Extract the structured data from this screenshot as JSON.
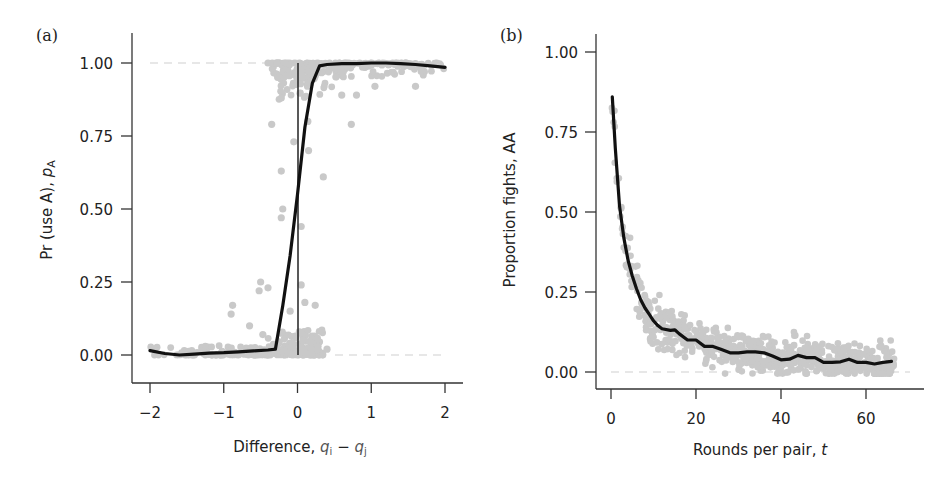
{
  "chart_data": [
    {
      "panel": "(a)",
      "type": "scatter",
      "title": "",
      "xlabel": "Difference, q_i − q_j",
      "xlabel_parts": {
        "main": "Difference, ",
        "var1": "q",
        "sub1": "i",
        "op": " − ",
        "var2": "q",
        "sub2": "j"
      },
      "ylabel": "Pr (use A), p_A",
      "ylabel_parts": {
        "main": "Pr (use A), ",
        "var": "p",
        "sub": "A"
      },
      "xlim": [
        -2.2,
        2.25
      ],
      "ylim": [
        -0.1,
        1.1
      ],
      "xticks": [
        -2,
        -1,
        0,
        1,
        2
      ],
      "xtick_labels": [
        "−2",
        "−1",
        "0",
        "1",
        "2"
      ],
      "yticks": [
        0,
        0.25,
        0.5,
        0.75,
        1.0
      ],
      "ytick_labels": [
        "0.00",
        "0.25",
        "0.50",
        "0.75",
        "1.00"
      ],
      "reference_lines": {
        "horizontal_dashed": [
          0,
          1
        ],
        "vertical_solid_x": 0
      },
      "grid": false,
      "series": [
        {
          "name": "fitted curve",
          "style": "line",
          "x": [
            -2.0,
            -1.8,
            -1.6,
            -1.4,
            -1.2,
            -1.0,
            -0.8,
            -0.6,
            -0.4,
            -0.3,
            -0.2,
            -0.1,
            0.0,
            0.1,
            0.2,
            0.3,
            0.4,
            0.6,
            0.8,
            1.0,
            1.2,
            1.4,
            1.6,
            1.8,
            2.0
          ],
          "y": [
            0.015,
            0.005,
            0.0,
            0.003,
            0.006,
            0.008,
            0.011,
            0.014,
            0.017,
            0.02,
            0.17,
            0.34,
            0.55,
            0.78,
            0.93,
            0.99,
            0.995,
            0.998,
            0.998,
            1.0,
            1.0,
            0.998,
            0.995,
            0.99,
            0.985
          ]
        },
        {
          "name": "observations",
          "style": "scatter",
          "note": "dense grey points clustered at 0 for x<0 and at 1 for x>0; sparse intermediates near x=0",
          "highlighted_points": [
            {
              "x": -0.9,
              "y": 0.14
            },
            {
              "x": -0.88,
              "y": 0.17
            },
            {
              "x": -0.65,
              "y": 0.1
            },
            {
              "x": -0.5,
              "y": 0.25
            },
            {
              "x": -0.52,
              "y": 0.22
            },
            {
              "x": -0.4,
              "y": 0.23
            },
            {
              "x": -0.47,
              "y": 0.07
            },
            {
              "x": -0.35,
              "y": 0.79
            },
            {
              "x": -0.22,
              "y": 0.88
            },
            {
              "x": -0.22,
              "y": 0.63
            },
            {
              "x": -0.2,
              "y": 0.5
            },
            {
              "x": -0.22,
              "y": 0.47
            },
            {
              "x": -0.1,
              "y": 0.15
            },
            {
              "x": 0.05,
              "y": 0.44
            },
            {
              "x": 0.05,
              "y": 0.24
            },
            {
              "x": 0.1,
              "y": 0.18
            },
            {
              "x": 0.24,
              "y": 0.17
            },
            {
              "x": 0.14,
              "y": 0.8
            },
            {
              "x": 0.15,
              "y": 0.7
            },
            {
              "x": -0.05,
              "y": 0.73
            },
            {
              "x": 0.35,
              "y": 0.61
            },
            {
              "x": 0.6,
              "y": 0.89
            },
            {
              "x": 0.8,
              "y": 0.89
            },
            {
              "x": 0.73,
              "y": 0.79
            },
            {
              "x": 1.05,
              "y": 0.92
            },
            {
              "x": 1.6,
              "y": 0.92
            },
            {
              "x": -0.4,
              "y": 1.0
            },
            {
              "x": 0.4,
              "y": 0.02
            }
          ]
        }
      ]
    },
    {
      "panel": "(b)",
      "type": "scatter",
      "title": "",
      "xlabel": "Rounds per pair, t",
      "xlabel_parts": {
        "main": "Rounds per pair, ",
        "var": "t"
      },
      "ylabel": "Proportion fights, AA",
      "xlim": [
        -4,
        74
      ],
      "ylim": [
        -0.05,
        1.05
      ],
      "xticks": [
        0,
        20,
        40,
        60
      ],
      "xtick_labels": [
        "0",
        "20",
        "40",
        "60"
      ],
      "yticks": [
        0,
        0.25,
        0.5,
        0.75,
        1.0
      ],
      "ytick_labels": [
        "0.00",
        "0.25",
        "0.50",
        "0.75",
        "1.00"
      ],
      "reference_lines": {
        "horizontal_dashed": [
          0
        ]
      },
      "grid": false,
      "series": [
        {
          "name": "fitted curve",
          "style": "line",
          "x": [
            0.3,
            1,
            2,
            3,
            4,
            5,
            6,
            7,
            8,
            9,
            10,
            11,
            12,
            14,
            15,
            16,
            18,
            20,
            22,
            24,
            26,
            28,
            30,
            32,
            34,
            36,
            38,
            40,
            42,
            44,
            46,
            48,
            50,
            52,
            54,
            56,
            58,
            60,
            62,
            64,
            66
          ],
          "y": [
            0.86,
            0.7,
            0.52,
            0.42,
            0.35,
            0.3,
            0.26,
            0.225,
            0.2,
            0.18,
            0.16,
            0.145,
            0.135,
            0.13,
            0.132,
            0.12,
            0.1,
            0.1,
            0.08,
            0.08,
            0.07,
            0.06,
            0.06,
            0.063,
            0.063,
            0.06,
            0.05,
            0.038,
            0.04,
            0.052,
            0.045,
            0.045,
            0.03,
            0.03,
            0.032,
            0.04,
            0.03,
            0.03,
            0.025,
            0.03,
            0.033
          ]
        },
        {
          "name": "observations",
          "style": "scatter",
          "note": "grey points scattered around the fitted curve from t=0 to t≈67"
        }
      ]
    }
  ],
  "panel_a": {
    "label": "(a)",
    "ytick_labels": [
      "1.00",
      "0.75",
      "0.50",
      "0.25",
      "0.00"
    ],
    "xtick_labels": [
      "−2",
      "−1",
      "0",
      "1",
      "2"
    ],
    "ylabel_main": "Pr (use A), ",
    "ylabel_var": "p",
    "ylabel_sub": "A",
    "xlabel_main": "Difference, ",
    "xlabel_var1": "q",
    "xlabel_sub1": "i",
    "xlabel_op": " − ",
    "xlabel_var2": "q",
    "xlabel_sub2": "j"
  },
  "panel_b": {
    "label": "(b)",
    "ytick_labels": [
      "1.00",
      "0.75",
      "0.50",
      "0.25",
      "0.00"
    ],
    "xtick_labels": [
      "0",
      "20",
      "40",
      "60"
    ],
    "ylabel": "Proportion fights, AA",
    "xlabel_main": "Rounds per pair, ",
    "xlabel_var": "t"
  },
  "colors": {
    "points": "#c9c9c9",
    "curve": "#111111",
    "axis": "#333333",
    "reference": "#cfcfcf"
  }
}
